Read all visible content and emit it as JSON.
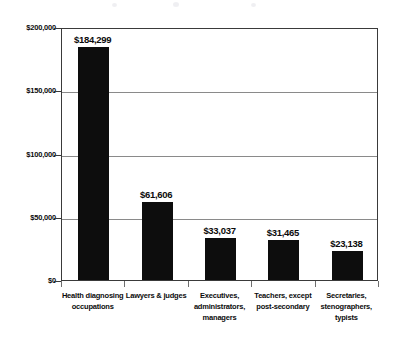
{
  "chart_data": {
    "type": "bar",
    "title": "",
    "subtitle": "",
    "xlabel": "",
    "ylabel": "",
    "ylim": [
      0,
      200000
    ],
    "grid": true,
    "legend": false,
    "legend_position": "none",
    "categories": [
      "Health diagnosing occupations",
      "Lawyers & judges",
      "Executives, administrators, managers",
      "Teachers, except post-secondary",
      "Secretaries, stenographers, typists"
    ],
    "category_lines": [
      [
        "Health diagnosing",
        "occupations"
      ],
      [
        "Lawyers & judges"
      ],
      [
        "Executives,",
        "administrators,",
        "managers"
      ],
      [
        "Teachers, except",
        "post-secondary"
      ],
      [
        "Secretaries,",
        "stenographers,",
        "typists"
      ]
    ],
    "values": [
      184299,
      61606,
      33037,
      31465,
      23138
    ],
    "value_labels": [
      "$184,299",
      "$61,606",
      "$33,037",
      "$31,465",
      "$23,138"
    ],
    "ytick_values": [
      0,
      50000,
      100000,
      150000,
      200000
    ],
    "ytick_labels": [
      "$0",
      "$50,000",
      "$100,000",
      "$150,000",
      "$200,000"
    ],
    "bar_color": "#0d0d0d",
    "grid_color": "#8a8a8a",
    "axis_color": "#3a3a3a",
    "background_color": "#ffffff"
  }
}
